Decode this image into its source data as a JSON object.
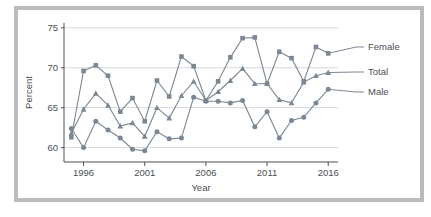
{
  "figure": {
    "background_color": "#ffffff",
    "frame_color": "#b9bcbf",
    "series_color": "#7b8794",
    "grid_color": "#c9ccd0",
    "axis_color": "#4a4f54"
  },
  "chart_data": {
    "type": "line",
    "title": "",
    "xlabel": "Year",
    "ylabel": "Percent",
    "xlim": [
      1994.4,
      2016.8
    ],
    "ylim": [
      58.2,
      75.6
    ],
    "xticks": [
      1996,
      2001,
      2006,
      2011,
      2016
    ],
    "xticklabels": [
      "1996",
      "2001",
      "2006",
      "2011",
      "2016"
    ],
    "yticks": [
      60,
      65,
      70,
      75
    ],
    "yticklabels": [
      "60",
      "65",
      "70",
      "75"
    ],
    "grid": "horizontal",
    "legend_position": "right-inline",
    "x": [
      1995,
      1996,
      1997,
      1998,
      1999,
      2000,
      2001,
      2002,
      2003,
      2004,
      2005,
      2006,
      2007,
      2008,
      2009,
      2010,
      2011,
      2012,
      2013,
      2014,
      2015,
      2016
    ],
    "series": [
      {
        "name": "Female",
        "marker": "square",
        "values": [
          61.3,
          69.6,
          70.3,
          69.0,
          64.5,
          66.2,
          63.3,
          68.4,
          66.4,
          71.4,
          70.2,
          65.9,
          68.3,
          71.3,
          73.7,
          73.8,
          68.0,
          72.0,
          71.2,
          68.3,
          72.6,
          71.8
        ]
      },
      {
        "name": "Total",
        "marker": "triangle",
        "values": [
          61.8,
          64.8,
          66.8,
          65.3,
          62.7,
          63.1,
          61.4,
          65.0,
          63.7,
          66.5,
          68.3,
          65.9,
          67.0,
          68.4,
          69.9,
          68.0,
          68.0,
          66.0,
          65.6,
          68.2,
          69.0,
          69.4
        ]
      },
      {
        "name": "Male",
        "marker": "circle",
        "values": [
          62.4,
          60.0,
          63.3,
          62.2,
          61.2,
          59.8,
          59.6,
          62.0,
          61.1,
          61.2,
          66.3,
          65.8,
          65.8,
          65.6,
          65.9,
          62.6,
          64.5,
          61.2,
          63.4,
          63.8,
          65.6,
          67.3
        ]
      }
    ],
    "legend_entries": [
      {
        "label": "Female",
        "marker": "square"
      },
      {
        "label": "Total",
        "marker": "triangle"
      },
      {
        "label": "Male",
        "marker": "circle"
      }
    ]
  }
}
